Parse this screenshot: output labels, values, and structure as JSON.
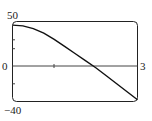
{
  "chart_data": {
    "type": "line",
    "title": "",
    "xlabel": "",
    "ylabel": "",
    "xlim": [
      0,
      3
    ],
    "ylim": [
      -40,
      50
    ],
    "grid": false,
    "legend": null,
    "tick_labels": {
      "y_top": "50",
      "y_zero": "0",
      "y_bottom": "−40",
      "x_right": "3"
    },
    "x_ticks": [
      1,
      2
    ],
    "y_ticks": [
      -20,
      20,
      40
    ],
    "series": [
      {
        "name": "f(x)",
        "x": [
          0,
          0.25,
          0.5,
          0.75,
          1.0,
          1.25,
          1.5,
          1.75,
          2.0,
          2.25,
          2.5,
          2.75,
          3.0
        ],
        "y": [
          46,
          45,
          42,
          37,
          30,
          22,
          14,
          6,
          -2,
          -11,
          -20,
          -29,
          -38
        ]
      }
    ]
  }
}
